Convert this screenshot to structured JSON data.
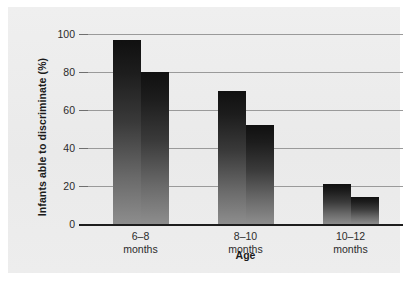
{
  "chart_data": {
    "type": "bar",
    "title": "",
    "xlabel": "Age",
    "ylabel": "Infants able to discriminate (%)",
    "categories": [
      "6–8\nmonths",
      "8–10\nmonths",
      "10–12\nmonths"
    ],
    "category_lines": [
      [
        "6–8",
        "months"
      ],
      [
        "8–10",
        "months"
      ],
      [
        "10–12",
        "months"
      ]
    ],
    "series": [
      {
        "name": "bar-1",
        "values": [
          97,
          70,
          21
        ]
      },
      {
        "name": "bar-2",
        "values": [
          80,
          52,
          14
        ]
      }
    ],
    "ylim": [
      0,
      100
    ],
    "yticks": [
      0,
      20,
      40,
      60,
      80,
      100
    ],
    "ytick_labels": [
      "0",
      "20",
      "40",
      "60",
      "80",
      "100"
    ],
    "grid": true,
    "legend": "none",
    "bar_fill": "#1a1a1a",
    "bar_fill_bottom": "#8d8d8d",
    "panel_color": "#ececec",
    "gridline_color": "#9a9a9a",
    "axis_color": "#1d1d1d"
  }
}
